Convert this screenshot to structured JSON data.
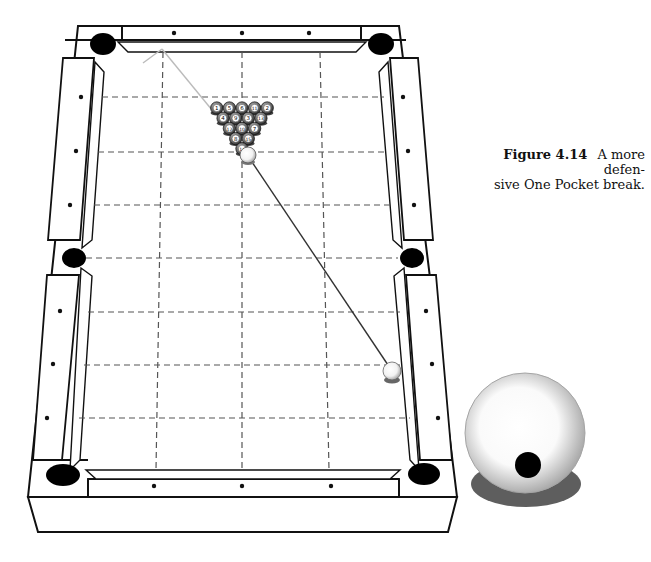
{
  "figure": {
    "label": "Figure 4.14",
    "caption": "A more defensive One Pocket break.",
    "caption_line1": "A more defen-",
    "caption_line2": "sive One Pocket break."
  },
  "table": {
    "type": "pool-table-top-view",
    "pockets": [
      "top-left-corner",
      "top-right-corner",
      "left-side",
      "right-side",
      "bottom-left-corner",
      "bottom-right-corner"
    ],
    "grid": {
      "columns": 4,
      "rows": 8,
      "line_style": "dashed"
    },
    "diamonds_per_long_rail": 3,
    "diamonds_per_short_rail": 3
  },
  "rack": {
    "ball_numbers_rows": [
      [
        "1",
        "5",
        "6",
        "11",
        "2"
      ],
      [
        "4",
        "9",
        "3",
        "13"
      ],
      [
        "12",
        "10",
        "7"
      ],
      [
        "8",
        "15"
      ],
      [
        "14"
      ]
    ]
  },
  "cue_ball": {
    "label": "cue ball",
    "position": "lower right of table"
  },
  "shot": {
    "description": "cue ball path to rack head ball, then deflected line toward top-left"
  },
  "detail_ball": {
    "label": "cue ball contact point illustration",
    "contact": "below center"
  },
  "colors": {
    "line": "#111111",
    "grid": "#555555",
    "pocket": "#000000",
    "shot_line": "#333333",
    "deflect_line": "#bbbbbb",
    "shadow": "#666666"
  }
}
